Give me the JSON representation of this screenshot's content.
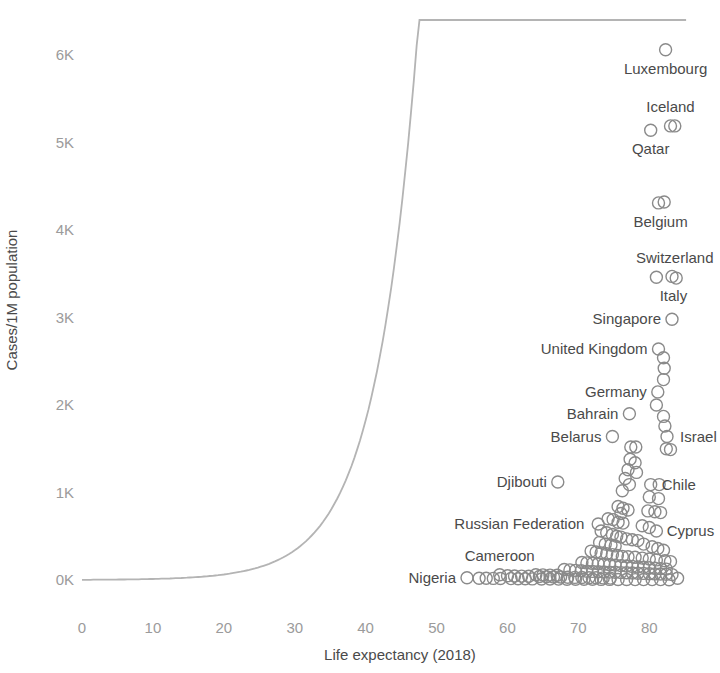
{
  "chart_data": {
    "type": "scatter",
    "title": "",
    "xlabel": "Life expectancy (2018)",
    "ylabel": "Cases/1M population",
    "xlim": [
      0,
      88
    ],
    "ylim": [
      0,
      6400
    ],
    "grid": false,
    "legend": null,
    "xticks": [
      0,
      10,
      20,
      30,
      40,
      50,
      60,
      70,
      80
    ],
    "xtick_labels": [
      "0",
      "10",
      "20",
      "30",
      "40",
      "50",
      "60",
      "70",
      "80"
    ],
    "yticks": [
      0,
      1000,
      2000,
      3000,
      4000,
      5000,
      6000
    ],
    "ytick_labels": [
      "0K",
      "1K",
      "2K",
      "3K",
      "4K",
      "5K",
      "6K"
    ],
    "marker": "open-circle",
    "marker_color": "#8a8a8a",
    "trendline": {
      "present": true,
      "color": "#b4b4b4",
      "description": "smooth exponential-like fit, flat near zero until ~65 then rising steeply"
    },
    "annotations": [
      {
        "label": "Luxembourg",
        "x": 82.3,
        "y": 6060
      },
      {
        "label": "Iceland",
        "x": 83.0,
        "y": 5190
      },
      {
        "label": "Qatar",
        "x": 80.2,
        "y": 5140
      },
      {
        "label": "Belgium",
        "x": 81.6,
        "y": 4310
      },
      {
        "label": "Switzerland",
        "x": 83.6,
        "y": 3460
      },
      {
        "label": "Italy",
        "x": 83.4,
        "y": 3460
      },
      {
        "label": "Singapore",
        "x": 83.2,
        "y": 2980
      },
      {
        "label": "United Kingdom",
        "x": 81.3,
        "y": 2640
      },
      {
        "label": "Germany",
        "x": 81.2,
        "y": 2150
      },
      {
        "label": "Bahrain",
        "x": 77.2,
        "y": 1900
      },
      {
        "label": "Belarus",
        "x": 74.8,
        "y": 1640
      },
      {
        "label": "Israel",
        "x": 82.8,
        "y": 1640
      },
      {
        "label": "Chile",
        "x": 80.2,
        "y": 1090
      },
      {
        "label": "Djibouti",
        "x": 67.1,
        "y": 1120
      },
      {
        "label": "Russian Federation",
        "x": 72.4,
        "y": 640
      },
      {
        "label": "Cyprus",
        "x": 80.9,
        "y": 560
      },
      {
        "label": "Cameroon",
        "x": 58.9,
        "y": 60
      },
      {
        "label": "Nigeria",
        "x": 54.3,
        "y": 25
      }
    ],
    "labeled_points": [
      {
        "label": "Luxembourg",
        "x": 82.3,
        "y": 6060
      },
      {
        "label": "Iceland",
        "x": 83.0,
        "y": 5190
      },
      {
        "label": "Iceland",
        "x": 83.6,
        "y": 5190
      },
      {
        "label": "Qatar",
        "x": 80.2,
        "y": 5140
      },
      {
        "label": "Belgium",
        "x": 81.3,
        "y": 4310
      },
      {
        "label": "Belgium",
        "x": 82.1,
        "y": 4320
      },
      {
        "label": "Switzerland",
        "x": 81.0,
        "y": 3460
      },
      {
        "label": "Italy",
        "x": 83.2,
        "y": 3470
      },
      {
        "label": "Italy",
        "x": 83.8,
        "y": 3450
      },
      {
        "label": "Singapore",
        "x": 83.2,
        "y": 2980
      },
      {
        "label": "United Kingdom",
        "x": 81.3,
        "y": 2640
      },
      {
        "label": "Germany",
        "x": 81.2,
        "y": 2150
      },
      {
        "label": "Bahrain",
        "x": 77.2,
        "y": 1900
      },
      {
        "label": "Belarus",
        "x": 74.8,
        "y": 1640
      },
      {
        "label": "Israel",
        "x": 82.5,
        "y": 1640
      },
      {
        "label": "Chile",
        "x": 80.2,
        "y": 1090
      },
      {
        "label": "Djibouti",
        "x": 67.1,
        "y": 1120
      },
      {
        "label": "Russian Federation",
        "x": 72.8,
        "y": 640
      },
      {
        "label": "Cyprus",
        "x": 81.0,
        "y": 560
      },
      {
        "label": "Cameroon",
        "x": 58.9,
        "y": 60
      },
      {
        "label": "Nigeria",
        "x": 54.3,
        "y": 25
      }
    ],
    "points": [
      [
        82.3,
        6060
      ],
      [
        83.0,
        5190
      ],
      [
        83.6,
        5190
      ],
      [
        80.2,
        5140
      ],
      [
        81.3,
        4310
      ],
      [
        82.1,
        4320
      ],
      [
        81.0,
        3460
      ],
      [
        83.2,
        3470
      ],
      [
        83.8,
        3450
      ],
      [
        83.2,
        2980
      ],
      [
        81.3,
        2640
      ],
      [
        82.0,
        2540
      ],
      [
        82.1,
        2420
      ],
      [
        82.0,
        2290
      ],
      [
        81.2,
        2150
      ],
      [
        77.2,
        1900
      ],
      [
        81.0,
        2000
      ],
      [
        82.0,
        1870
      ],
      [
        82.2,
        1760
      ],
      [
        74.8,
        1640
      ],
      [
        82.5,
        1640
      ],
      [
        82.4,
        1500
      ],
      [
        83.0,
        1490
      ],
      [
        77.4,
        1520
      ],
      [
        78.1,
        1520
      ],
      [
        77.3,
        1380
      ],
      [
        78.0,
        1340
      ],
      [
        77.0,
        1260
      ],
      [
        78.2,
        1230
      ],
      [
        76.6,
        1160
      ],
      [
        77.2,
        1090
      ],
      [
        67.1,
        1120
      ],
      [
        80.2,
        1090
      ],
      [
        81.4,
        1090
      ],
      [
        76.2,
        1020
      ],
      [
        80.0,
        950
      ],
      [
        81.3,
        930
      ],
      [
        75.6,
        840
      ],
      [
        76.3,
        820
      ],
      [
        77.0,
        800
      ],
      [
        76.0,
        760
      ],
      [
        79.8,
        790
      ],
      [
        80.8,
        780
      ],
      [
        81.6,
        770
      ],
      [
        74.2,
        700
      ],
      [
        74.9,
        690
      ],
      [
        75.6,
        660
      ],
      [
        76.3,
        650
      ],
      [
        72.8,
        640
      ],
      [
        79.0,
        620
      ],
      [
        80.0,
        600
      ],
      [
        81.0,
        560
      ],
      [
        73.2,
        560
      ],
      [
        74.0,
        540
      ],
      [
        74.8,
        520
      ],
      [
        75.4,
        500
      ],
      [
        76.0,
        490
      ],
      [
        76.8,
        470
      ],
      [
        77.6,
        460
      ],
      [
        78.4,
        450
      ],
      [
        73.0,
        430
      ],
      [
        73.8,
        410
      ],
      [
        74.6,
        400
      ],
      [
        75.2,
        390
      ],
      [
        79.2,
        410
      ],
      [
        80.4,
        380
      ],
      [
        81.2,
        360
      ],
      [
        82.0,
        340
      ],
      [
        71.8,
        330
      ],
      [
        72.5,
        320
      ],
      [
        73.2,
        310
      ],
      [
        74.0,
        300
      ],
      [
        74.8,
        290
      ],
      [
        75.5,
        280
      ],
      [
        76.2,
        270
      ],
      [
        77.0,
        265
      ],
      [
        78.0,
        260
      ],
      [
        79.0,
        250
      ],
      [
        80.0,
        240
      ],
      [
        81.0,
        230
      ],
      [
        82.2,
        220
      ],
      [
        83.0,
        210
      ],
      [
        70.5,
        200
      ],
      [
        71.2,
        195
      ],
      [
        72.0,
        190
      ],
      [
        72.8,
        185
      ],
      [
        73.6,
        180
      ],
      [
        74.4,
        175
      ],
      [
        75.2,
        170
      ],
      [
        76.0,
        165
      ],
      [
        76.8,
        160
      ],
      [
        77.6,
        155
      ],
      [
        78.4,
        150
      ],
      [
        79.2,
        145
      ],
      [
        80.0,
        140
      ],
      [
        80.8,
        135
      ],
      [
        81.6,
        130
      ],
      [
        82.4,
        125
      ],
      [
        68.0,
        120
      ],
      [
        68.8,
        115
      ],
      [
        69.6,
        110
      ],
      [
        70.4,
        105
      ],
      [
        71.2,
        100
      ],
      [
        72.0,
        98
      ],
      [
        72.8,
        95
      ],
      [
        73.6,
        92
      ],
      [
        74.4,
        90
      ],
      [
        75.2,
        88
      ],
      [
        76.0,
        85
      ],
      [
        76.8,
        82
      ],
      [
        77.6,
        80
      ],
      [
        78.4,
        78
      ],
      [
        79.2,
        75
      ],
      [
        80.0,
        72
      ],
      [
        80.8,
        70
      ],
      [
        81.6,
        68
      ],
      [
        82.4,
        65
      ],
      [
        83.2,
        62
      ],
      [
        64.0,
        60
      ],
      [
        65.0,
        58
      ],
      [
        66.0,
        56
      ],
      [
        67.0,
        54
      ],
      [
        58.9,
        60
      ],
      [
        60.0,
        48
      ],
      [
        61.0,
        46
      ],
      [
        62.0,
        44
      ],
      [
        63.0,
        42
      ],
      [
        64.5,
        40
      ],
      [
        65.5,
        38
      ],
      [
        66.5,
        36
      ],
      [
        67.5,
        34
      ],
      [
        68.5,
        32
      ],
      [
        69.5,
        30
      ],
      [
        70.5,
        28
      ],
      [
        71.5,
        26
      ],
      [
        72.5,
        25
      ],
      [
        73.5,
        24
      ],
      [
        74.5,
        22
      ],
      [
        54.3,
        25
      ],
      [
        56.0,
        20
      ],
      [
        57.0,
        19
      ],
      [
        58.0,
        18
      ],
      [
        59.0,
        17
      ],
      [
        60.5,
        16
      ],
      [
        61.5,
        15
      ],
      [
        62.5,
        14
      ],
      [
        63.5,
        13
      ],
      [
        64.8,
        12
      ],
      [
        66.0,
        11
      ],
      [
        67.2,
        10
      ],
      [
        68.4,
        9
      ],
      [
        69.6,
        9
      ],
      [
        70.8,
        8
      ],
      [
        72.0,
        8
      ],
      [
        73.2,
        7
      ],
      [
        74.4,
        7
      ],
      [
        75.6,
        6
      ],
      [
        76.8,
        6
      ],
      [
        78.0,
        5
      ],
      [
        79.2,
        5
      ],
      [
        80.4,
        4
      ],
      [
        81.6,
        4
      ],
      [
        82.8,
        3
      ],
      [
        84.0,
        20
      ]
    ]
  },
  "axes": {
    "x_title": "Life expectancy (2018)",
    "y_title": "Cases/1M population"
  }
}
